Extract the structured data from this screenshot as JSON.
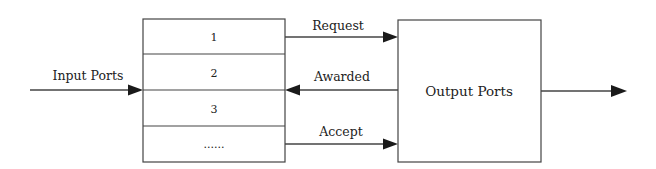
{
  "diagram": {
    "input_label": "Input Ports",
    "buffer_slots": [
      "1",
      "2",
      "3",
      "......"
    ],
    "output_box_label": "Output Ports",
    "signals": {
      "request": "Request",
      "awarded": "Awarded",
      "accept": "Accept"
    },
    "colors": {
      "line": "#444444",
      "arrowhead": "#1a1a1a",
      "text": "#222222",
      "background": "#ffffff"
    }
  }
}
